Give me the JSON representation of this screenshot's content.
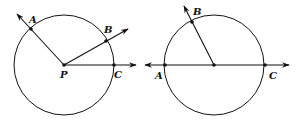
{
  "figures": [
    {
      "id": "left",
      "description": "Circle with center P and three rays PA, PB, PC intersecting the circle",
      "labels": {
        "center": "P",
        "a": "A",
        "b": "B",
        "c": "C"
      }
    },
    {
      "id": "right",
      "description": "Circle with diameter AC as a line with arrows, and ray to B",
      "labels": {
        "a": "A",
        "b": "B",
        "c": "C"
      }
    }
  ],
  "colors": {
    "stroke": "#111111",
    "background": "#ffffff"
  }
}
